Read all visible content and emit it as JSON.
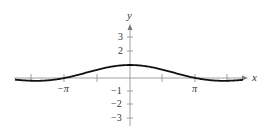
{
  "chart_data": {
    "type": "line",
    "title": "",
    "function": "y = sin(x)/x",
    "xlabel": "x",
    "ylabel": "y",
    "xlim": [
      -4.0,
      4.9
    ],
    "ylim": [
      -3.3,
      4.0
    ],
    "grid": false,
    "legend": null,
    "x_ticks": [
      {
        "value": -4.712,
        "label": ""
      },
      {
        "value": -3.1416,
        "label": "−π"
      },
      {
        "value": -1.5708,
        "label": ""
      },
      {
        "value": 1.5708,
        "label": ""
      },
      {
        "value": 3.1416,
        "label": "π"
      },
      {
        "value": 4.712,
        "label": ""
      }
    ],
    "y_ticks": [
      {
        "value": 3,
        "label": "3"
      },
      {
        "value": 2,
        "label": "2"
      },
      {
        "value": 1,
        "label": ""
      },
      {
        "value": -1,
        "label": "−1"
      },
      {
        "value": -2,
        "label": "−2"
      },
      {
        "value": -3,
        "label": "−3"
      }
    ],
    "series": [
      {
        "name": "y = sin(x)/x",
        "x": [
          -5.2,
          -4.712,
          -4.0,
          -3.1416,
          -2.5,
          -1.5708,
          -1.0,
          0,
          1.0,
          1.5708,
          2.5,
          3.1416,
          4.0,
          4.712,
          5.2
        ],
        "y": [
          -0.17,
          -0.212,
          -0.189,
          0.0,
          0.239,
          0.637,
          0.841,
          1.0,
          0.841,
          0.637,
          0.239,
          0.0,
          -0.189,
          -0.212,
          -0.17
        ]
      }
    ]
  },
  "labels": {
    "x_axis": "x",
    "y_axis": "y",
    "neg_pi": "−π",
    "pos_pi": "π",
    "y3": "3",
    "y2": "2",
    "yn1": "−1",
    "yn2": "−2",
    "yn3": "−3"
  }
}
